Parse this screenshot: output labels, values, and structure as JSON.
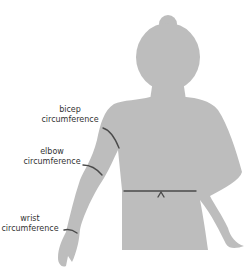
{
  "diagram": {
    "figure": "body-silhouette",
    "colors": {
      "background": "#ffffff",
      "silhouette": "#bdbdbd",
      "measure_line": "#4a4a4a",
      "label_text": "#333333"
    },
    "labels": {
      "bicep": {
        "line1": "bicep",
        "line2": "circumference"
      },
      "elbow": {
        "line1": "elbow",
        "line2": "circumference"
      },
      "wrist": {
        "line1": "wrist",
        "line2": "circumference"
      }
    },
    "measurements": [
      "bicep circumference",
      "elbow circumference",
      "wrist circumference",
      "waist"
    ]
  }
}
